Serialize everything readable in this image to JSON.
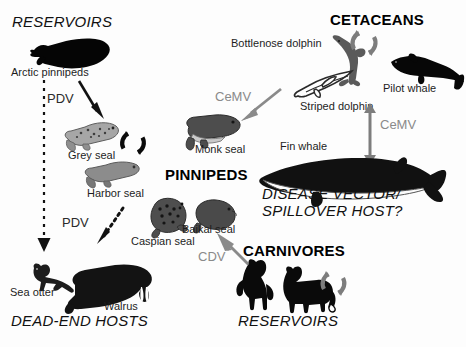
{
  "figure": {
    "type": "transmission-cycle-diagram"
  },
  "groups": {
    "cetaceans": "CETACEANS",
    "pinnipeds": "PINNIPEDS",
    "carnivores": "CARNIVORES"
  },
  "roles": {
    "reservoirs_top": "RESERVOIRS",
    "reservoirs_bottom": "RESERVOIRS",
    "dead_end_hosts": "DEAD-END HOSTS",
    "disease_vector_line1": "DISEASE VECTOR/",
    "disease_vector_line2": "SPILLOVER HOST?"
  },
  "species": {
    "arctic_pinnipeds": "Arctic pinnipeds",
    "grey_seal": "Grey seal",
    "harbor_seal": "Harbor seal",
    "caspian_seal": "Caspian seal",
    "baikal_seal": "Baikal seal",
    "monk_seal": "Monk seal",
    "sea_otter": "Sea otter",
    "walrus": "Walrus",
    "bottlenose_dolphin": "Bottlenose dolphin",
    "striped_dolphin": "Striped dolphin",
    "pilot_whale": "Pilot whale",
    "fin_whale": "Fin whale"
  },
  "viruses": {
    "pdv_top": "PDV",
    "pdv_bottom": "PDV",
    "cemv_left": "CeMV",
    "cemv_right": "CeMV",
    "cdv": "CDV"
  },
  "colors": {
    "black": "#000000",
    "dark_silhouette": "#1a1a1a",
    "mid_gray": "#707070",
    "label_gray": "#8a8a8a",
    "light_seal": "#9a9a9a",
    "background": "#fdfdfd"
  },
  "icons": {
    "cycle_grey_seal": "transmission-cycle-icon",
    "cycle_cetacean": "transmission-cycle-icon",
    "cycle_carnivore": "transmission-cycle-icon"
  }
}
